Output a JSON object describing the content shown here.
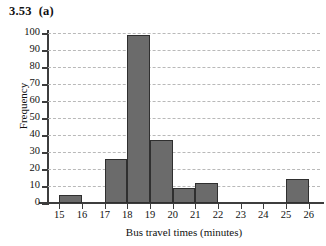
{
  "figure": {
    "number": "3.53",
    "part": "(a)"
  },
  "chart_data": {
    "type": "bar",
    "title": "",
    "xlabel": "Bus travel times (minutes)",
    "ylabel": "Frequency",
    "xlim": [
      14.5,
      26.5
    ],
    "ylim": [
      0,
      100
    ],
    "grid": true,
    "legend": false,
    "bar_fill_color": "#6b6b6b",
    "bar_edge_color": "#2f2f2f",
    "gridline_color": "#b9b9b9",
    "axis_color": "#3d3d3d",
    "xticks": [
      15,
      16,
      17,
      18,
      19,
      20,
      21,
      22,
      23,
      24,
      25,
      26
    ],
    "xtick_labels": [
      "15",
      "16",
      "17",
      "18",
      "19",
      "20",
      "21",
      "22",
      "23",
      "24",
      "25",
      "26"
    ],
    "yticks": [
      0,
      10,
      20,
      30,
      40,
      50,
      60,
      70,
      80,
      90,
      100
    ],
    "ytick_labels": [
      "0",
      "10",
      "20",
      "30",
      "40",
      "50",
      "60",
      "70",
      "80",
      "90",
      "100"
    ],
    "bin_edges": [
      15,
      16,
      17,
      18,
      19,
      20,
      21,
      22,
      23,
      24,
      25,
      26
    ],
    "bin_labels": [
      "15-16",
      "16-17",
      "17-18",
      "18-19",
      "19-20",
      "20-21",
      "21-22",
      "22-23",
      "23-24",
      "24-25",
      "25-26"
    ],
    "values": [
      5,
      0,
      26,
      99,
      37,
      9,
      12,
      0,
      0,
      0,
      14
    ],
    "bars": [
      {
        "label": "15-16",
        "start": 15,
        "end": 16,
        "value": 5
      },
      {
        "label": "16-17",
        "start": 16,
        "end": 17,
        "value": 0
      },
      {
        "label": "17-18",
        "start": 17,
        "end": 18,
        "value": 26
      },
      {
        "label": "18-19",
        "start": 18,
        "end": 19,
        "value": 99
      },
      {
        "label": "19-20",
        "start": 19,
        "end": 20,
        "value": 37
      },
      {
        "label": "20-21",
        "start": 20,
        "end": 21,
        "value": 9
      },
      {
        "label": "21-22",
        "start": 21,
        "end": 22,
        "value": 12
      },
      {
        "label": "22-23",
        "start": 22,
        "end": 23,
        "value": 0
      },
      {
        "label": "23-24",
        "start": 23,
        "end": 24,
        "value": 0
      },
      {
        "label": "24-25",
        "start": 24,
        "end": 25,
        "value": 0
      },
      {
        "label": "25-26",
        "start": 25,
        "end": 26,
        "value": 14
      }
    ]
  }
}
